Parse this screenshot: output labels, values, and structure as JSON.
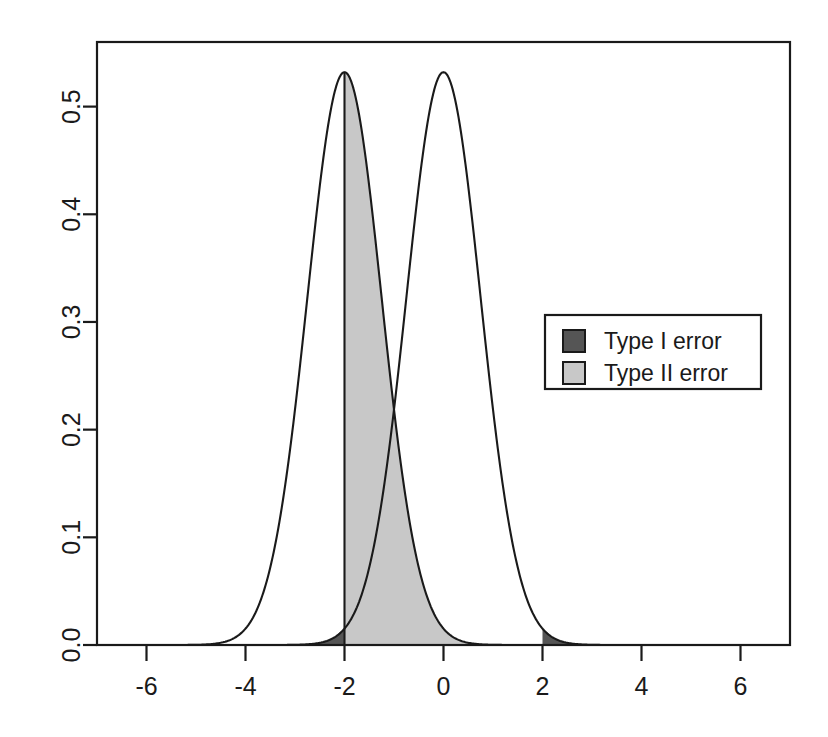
{
  "chart_data": {
    "type": "line",
    "title": "",
    "subtitle": "",
    "xlabel": "",
    "ylabel": "",
    "xlim": [
      -7,
      7
    ],
    "ylim": [
      0.0,
      0.56
    ],
    "grid": false,
    "legend_position": "right",
    "x_ticks": [
      "-6",
      "-4",
      "-2",
      "0",
      "2",
      "4",
      "6"
    ],
    "x_tick_values": [
      -6,
      -4,
      -2,
      0,
      2,
      4,
      6
    ],
    "y_ticks": [
      "0.0",
      "0.1",
      "0.2",
      "0.3",
      "0.4",
      "0.5"
    ],
    "y_tick_values": [
      0.0,
      0.1,
      0.2,
      0.3,
      0.4,
      0.5
    ],
    "series": [
      {
        "name": "alternative-distribution",
        "kind": "normal-density",
        "mean": -2,
        "sd": 0.75,
        "peak": 0.532,
        "stroke": "#1a1a1a"
      },
      {
        "name": "null-distribution",
        "kind": "normal-density",
        "mean": 0,
        "sd": 0.75,
        "peak": 0.532,
        "stroke": "#1a1a1a"
      }
    ],
    "critical_value": -2,
    "critical_value_upper": 2,
    "shaded_regions": [
      {
        "name": "type-1-error-left",
        "label": "Type I error",
        "distribution": "null-distribution",
        "from": -7,
        "to": -2,
        "fill": "#555555"
      },
      {
        "name": "type-1-error-right",
        "label": "Type I error",
        "distribution": "null-distribution",
        "from": 2,
        "to": 7,
        "fill": "#555555"
      },
      {
        "name": "type-2-error",
        "label": "Type II error",
        "distribution": "alternative-distribution",
        "from": -2,
        "to": 7,
        "fill": "#c8c8c8"
      }
    ]
  },
  "legend": {
    "items": [
      {
        "label": "Type I error",
        "color": "#555555"
      },
      {
        "label": "Type II error",
        "color": "#c8c8c8"
      }
    ]
  },
  "colors": {
    "type_1_error": "#555555",
    "type_2_error": "#c8c8c8",
    "axis": "#1a1a1a",
    "curve": "#1a1a1a",
    "background": "#ffffff"
  }
}
